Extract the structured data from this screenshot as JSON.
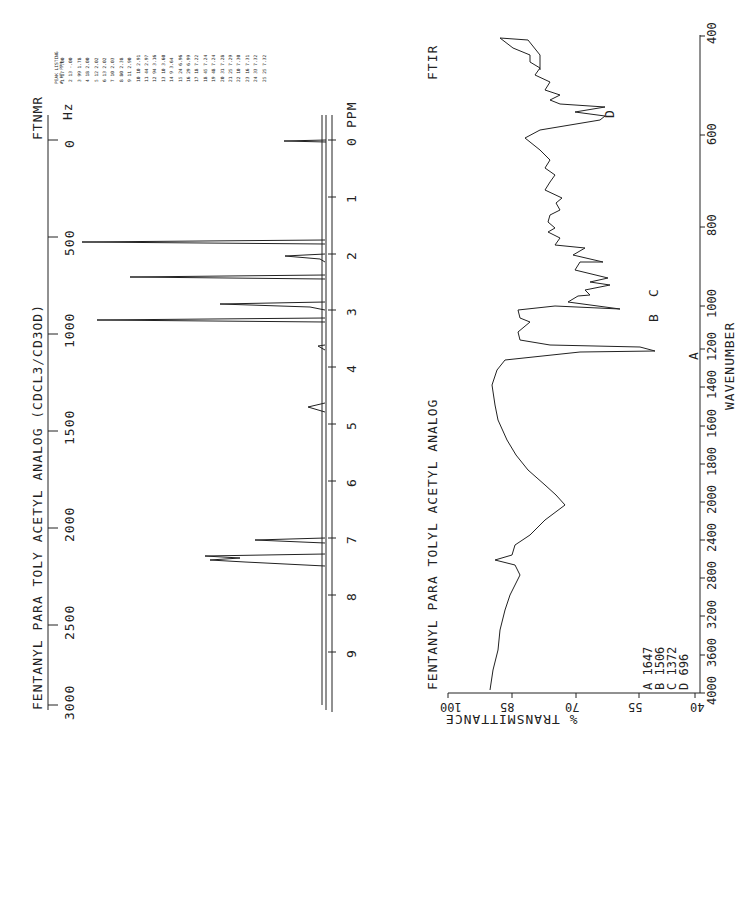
{
  "nmr": {
    "title": "FENTANYL PARA TOLY ACETYL ANALOG (CDCL3/CD3OD)",
    "tag": "FTNMR",
    "hz_unit": "Hz",
    "ppm_unit": "PPM",
    "hz_ticks": [
      "0",
      "500",
      "1000",
      "1500",
      "2000",
      "2500",
      "3000"
    ],
    "ppm_ticks": [
      "0",
      "1",
      "2",
      "3",
      "4",
      "5",
      "6",
      "7",
      "8",
      "9"
    ]
  },
  "peak_listing": {
    "title": "PEAK LISTING",
    "headers": [
      "#",
      "HT",
      "PPM"
    ],
    "rows": [
      [
        "1",
        "17",
        "-.00"
      ],
      [
        "2",
        "13",
        "-.00"
      ],
      [
        "3",
        "99",
        "1.78"
      ],
      [
        "4",
        "18",
        "2.00"
      ],
      [
        "5",
        "12",
        "2.02"
      ],
      [
        "6",
        "13",
        "2.02"
      ],
      [
        "7",
        "10",
        "2.03"
      ],
      [
        "8",
        "80",
        "2.38"
      ],
      [
        "9",
        "11",
        "2.90"
      ],
      [
        "10",
        "10",
        "2.91"
      ],
      [
        "11",
        "44",
        "2.97"
      ],
      [
        "12",
        "94",
        "3.16"
      ],
      [
        "13",
        "10",
        "3.60"
      ],
      [
        "14",
        "9",
        "3.64"
      ],
      [
        "15",
        "24",
        "6.96"
      ],
      [
        "16",
        "29",
        "6.99"
      ],
      [
        "17",
        "18",
        "7.22"
      ],
      [
        "18",
        "45",
        "7.24"
      ],
      [
        "19",
        "48",
        "7.24"
      ],
      [
        "20",
        "31",
        "7.28"
      ],
      [
        "21",
        "25",
        "7.29"
      ],
      [
        "22",
        "10",
        "7.30"
      ],
      [
        "23",
        "16",
        "7.31"
      ],
      [
        "24",
        "33",
        "7.32"
      ],
      [
        "25",
        "25",
        "7.32"
      ]
    ]
  },
  "ftir": {
    "title": "FENTANYL PARA TOLYL ACETYL ANALOG",
    "tag": "FTIR",
    "xlabel": "WAVENUMBER",
    "ylabel": "% TRANSMITTANCE",
    "x_ticks": [
      "4000",
      "3600",
      "3200",
      "2800",
      "2400",
      "2000",
      "1800",
      "1600",
      "1400",
      "1200",
      "1000",
      "800",
      "600",
      "400"
    ],
    "y_ticks": [
      "40",
      "55",
      "70",
      "85",
      "100"
    ],
    "peaks": [
      {
        "label": "A",
        "value": "1647"
      },
      {
        "label": "B",
        "value": "1506"
      },
      {
        "label": "C",
        "value": "1372"
      },
      {
        "label": "D",
        "value": "696"
      }
    ],
    "legend": [
      "A 1647",
      "B 1506",
      "C 1372",
      "D 696"
    ]
  },
  "chart_data": [
    {
      "type": "line",
      "title": "FENTANYL PARA TOLY ACETYL ANALOG (CDCL3/CD3OD)",
      "xlabel": "PPM",
      "x2label": "Hz",
      "xlim": [
        10,
        0
      ],
      "x2lim": [
        3000,
        0
      ],
      "series": [
        {
          "name": "FTNMR",
          "peaks_ppm": [
            0.0,
            1.78,
            2.0,
            2.38,
            2.97,
            3.16,
            3.62,
            4.7,
            6.96,
            6.99,
            7.24,
            7.28,
            7.32
          ],
          "peaks_rel_height": [
            17,
            99,
            18,
            80,
            44,
            94,
            10,
            5,
            24,
            29,
            48,
            31,
            33
          ]
        }
      ]
    },
    {
      "type": "line",
      "title": "FENTANYL PARA TOLYL ACETYL ANALOG",
      "xlabel": "WAVENUMBER",
      "ylabel": "% TRANSMITTANCE",
      "xlim": [
        4000,
        400
      ],
      "ylim": [
        40,
        100
      ],
      "series": [
        {
          "name": "FTIR",
          "x": [
            4000,
            3800,
            3600,
            3450,
            3200,
            3000,
            2960,
            2850,
            2700,
            2450,
            2100,
            1800,
            1700,
            1647,
            1600,
            1560,
            1506,
            1450,
            1372,
            1300,
            1250,
            1100,
            1000,
            900,
            800,
            750,
            696,
            600,
            500,
            420,
            400
          ],
          "y": [
            89,
            90,
            88,
            80,
            86,
            88,
            74,
            96,
            87,
            78,
            94,
            88,
            86,
            44,
            80,
            77,
            58,
            65,
            53,
            63,
            75,
            76,
            72,
            80,
            78,
            60,
            51,
            66,
            60,
            95,
            65
          ]
        }
      ],
      "annotations": [
        "A 1647",
        "B 1506",
        "C 1372",
        "D 696"
      ]
    }
  ]
}
